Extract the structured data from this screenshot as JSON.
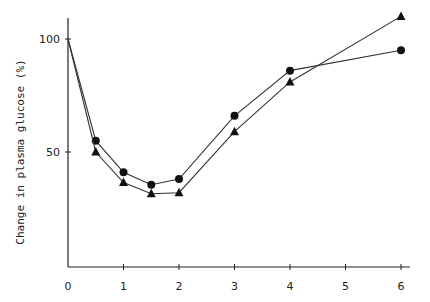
{
  "chart_data": {
    "type": "line",
    "title": "",
    "xlabel": "",
    "ylabel": "Change in plasma glucose (%)",
    "xlim": [
      0,
      6.3
    ],
    "ylim": [
      0,
      110
    ],
    "x_ticks": [
      0,
      1,
      2,
      3,
      4,
      5,
      6
    ],
    "y_ticks": [
      50,
      100
    ],
    "grid": false,
    "legend": null,
    "series": [
      {
        "name": "circles",
        "marker": "circle",
        "x": [
          0,
          0.5,
          1,
          1.5,
          2,
          3,
          4,
          6
        ],
        "values": [
          100,
          55,
          41,
          35.5,
          38,
          66,
          86,
          95
        ]
      },
      {
        "name": "triangles",
        "marker": "triangle",
        "x": [
          0,
          0.5,
          1,
          1.5,
          2,
          3,
          4,
          6
        ],
        "values": [
          100,
          50,
          36.5,
          31.5,
          32,
          59,
          81,
          110
        ]
      }
    ]
  },
  "axis": {
    "ylabel": "Change in plasma glucose (%)",
    "xtick_labels": [
      "0",
      "1",
      "2",
      "3",
      "4",
      "5",
      "6"
    ],
    "ytick_labels": [
      "50",
      "100"
    ]
  },
  "colors": {
    "ink": "#222222",
    "background": "#ffffff"
  }
}
